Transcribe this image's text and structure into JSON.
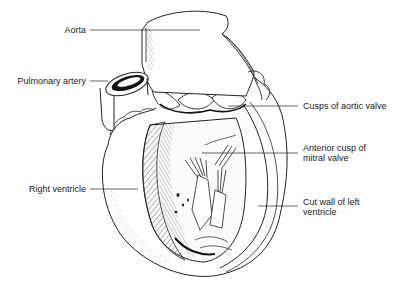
{
  "diagram": {
    "labels": {
      "aorta": "Aorta",
      "pulmonary_artery": "Pulmonary artery",
      "right_ventricle": "Right ventricle",
      "cusps_aortic_valve": "Cusps of aortic valve",
      "anterior_cusp_line1": "Anterior cusp of",
      "anterior_cusp_line2": "mitral valve",
      "cut_wall_line1": "Cut wall of left",
      "cut_wall_line2": "ventricle"
    },
    "colors": {
      "line": "#222222",
      "background": "#ffffff"
    }
  }
}
